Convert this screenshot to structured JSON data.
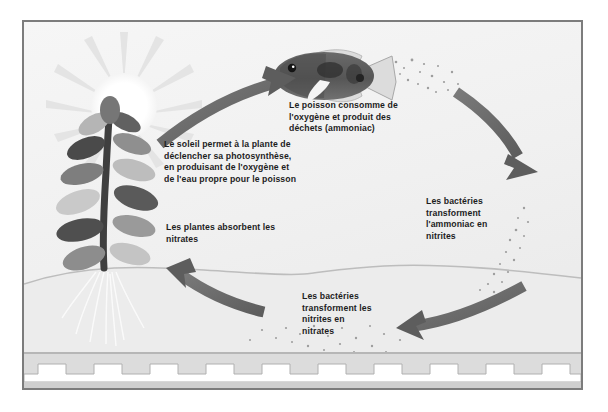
{
  "diagram": {
    "language": "fr",
    "style": "grayscale illustration",
    "colors": {
      "background": "#f2f2f2",
      "frame_border": "#7c7c7c",
      "arrow": "#6e6e6e",
      "arrow_dark": "#5a5a5a",
      "text": "#1d1d1d",
      "sun": "#ffffff",
      "sun_ray": "#e2e2e2",
      "plant_dark": "#4a4a4a",
      "plant_mid": "#8f8f8f",
      "plant_light": "#c9c9c9",
      "fish_body": "#5e5e5e",
      "fish_dark": "#3a3a3a",
      "fish_fin": "#d8d8d8",
      "particle": "#9a9a9a",
      "border_band": "#d0d0d0"
    },
    "captions": [
      {
        "id": "fish",
        "text": "Le poisson consomme de\nl'oxygène et produit des\ndéchets (ammoniac)"
      },
      {
        "id": "sun",
        "text": "Le soleil permet à la plante de\ndéclencher sa photosynthèse,\nen produisant de l'oxygène et\nde l'eau propre pour le poisson"
      },
      {
        "id": "ammonia",
        "text": "Les bactéries\ntransforment\nl'ammoniac en\nnitrites"
      },
      {
        "id": "plants",
        "text": "Les plantes absorbent les\nnitrates"
      },
      {
        "id": "nitrite",
        "text": "Les bactéries\ntransforment les\nnitrites en\nnitrates"
      }
    ],
    "elements": [
      {
        "id": "sun",
        "label": "Soleil"
      },
      {
        "id": "plant",
        "label": "Plante aquatique"
      },
      {
        "id": "fish",
        "label": "Poisson"
      },
      {
        "id": "waterline",
        "label": "Ligne d'eau"
      },
      {
        "id": "substrate-band",
        "label": "Bordure décorative"
      }
    ],
    "arrows": [
      {
        "id": "arrow-sun-to-fish",
        "direction": "up-right"
      },
      {
        "id": "arrow-fish-to-bacteria",
        "direction": "down-right"
      },
      {
        "id": "arrow-nitrite-to-nitrate",
        "direction": "left"
      },
      {
        "id": "arrow-nitrate-to-plant",
        "direction": "up-left"
      }
    ]
  }
}
